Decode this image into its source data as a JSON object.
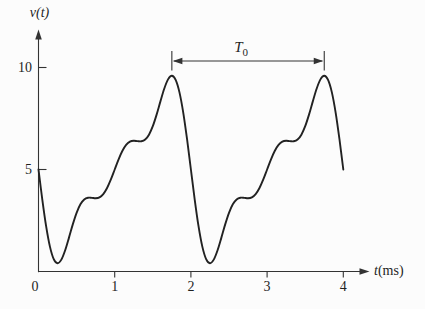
{
  "labels": {
    "y_axis": "v(t)",
    "x_axis_var": "t",
    "x_axis_unit": "(ms)",
    "origin": "0",
    "period_var": "T",
    "period_sub": "0"
  },
  "colors": {
    "ink": "#222222",
    "axis": "#333333",
    "background": "#fcfcfc"
  },
  "chart_data": {
    "type": "line",
    "title": "",
    "xlabel": "t(ms)",
    "ylabel": "v(t)",
    "xlim": [
      0,
      4.35
    ],
    "ylim": [
      0,
      11.7
    ],
    "x_ticks": [
      1,
      2,
      3,
      4
    ],
    "y_ticks": [
      5,
      10
    ],
    "grid": false,
    "legend": false,
    "period_annotation": {
      "label": "T0",
      "from_t": 1.75,
      "to_t": 3.75,
      "period_ms": 2
    },
    "series": [
      {
        "name": "v(t)",
        "t_start": 0,
        "t_step": 0.05,
        "t_end": 4,
        "v": [
          5.0,
          3.529,
          2.222,
          1.219,
          0.606,
          0.407,
          0.583,
          1.042,
          1.661,
          2.31,
          2.878,
          3.293,
          3.532,
          3.617,
          3.611,
          3.59,
          3.633,
          3.794,
          4.093,
          4.512,
          5.0,
          5.488,
          5.907,
          6.206,
          6.367,
          6.41,
          6.389,
          6.383,
          6.468,
          6.707,
          7.122,
          7.69,
          8.339,
          8.958,
          9.417,
          9.593,
          9.394,
          8.781,
          7.778,
          6.471,
          5.0,
          3.529,
          2.222,
          1.219,
          0.606,
          0.407,
          0.583,
          1.042,
          1.661,
          2.31,
          2.878,
          3.293,
          3.532,
          3.617,
          3.611,
          3.59,
          3.633,
          3.794,
          4.093,
          4.512,
          5.0,
          5.488,
          5.907,
          6.206,
          6.367,
          6.41,
          6.389,
          6.383,
          6.468,
          6.707,
          7.122,
          7.69,
          8.339,
          8.958,
          9.417,
          9.593,
          9.394,
          8.781,
          7.778,
          6.471,
          5.0
        ]
      }
    ]
  }
}
